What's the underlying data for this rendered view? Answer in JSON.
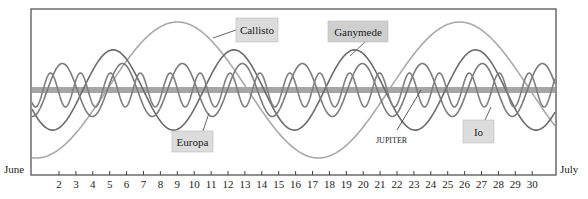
{
  "chart_data": {
    "type": "line",
    "title": "",
    "xlabel": "",
    "ylabel": "",
    "start_label": "June",
    "end_label": "July",
    "x_ticks": [
      2,
      3,
      4,
      5,
      6,
      7,
      8,
      9,
      10,
      11,
      12,
      13,
      14,
      15,
      16,
      17,
      18,
      19,
      20,
      21,
      22,
      23,
      24,
      25,
      26,
      27,
      28,
      29,
      30
    ],
    "xlim": [
      1,
      31
    ],
    "ylim": [
      -1,
      1
    ],
    "center_label": "JUPITER",
    "caption": "Figure 3 — Days in  June",
    "series": [
      {
        "name": "Callisto",
        "period_days": 16.7,
        "amplitude": 1.0,
        "peak_day": 9.0,
        "color": "#a9a9a9"
      },
      {
        "name": "Ganymede",
        "period_days": 7.15,
        "amplitude": 0.59,
        "peak_day": 5.2,
        "color": "#6b6b6b"
      },
      {
        "name": "Europa",
        "period_days": 3.55,
        "amplitude": 0.39,
        "peak_day": 2.2,
        "color": "#7a7a7a"
      },
      {
        "name": "Io",
        "period_days": 1.77,
        "amplitude": 0.25,
        "peak_day": 1.5,
        "color": "#808080"
      }
    ],
    "jupiter_band_color": "#a6a6a6"
  },
  "labels": {
    "callisto": "Callisto",
    "ganymede": "Ganymede",
    "europa": "Europa",
    "io": "Io",
    "jupiter": "JUPITER",
    "june": "June",
    "july": "July"
  }
}
